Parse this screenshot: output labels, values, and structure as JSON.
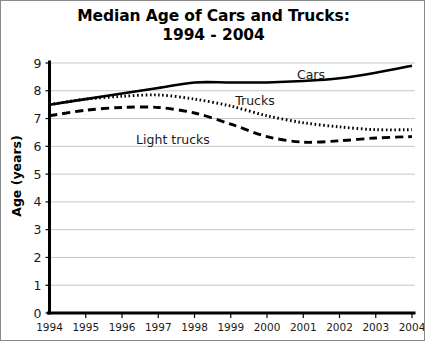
{
  "figure": {
    "title_line_1": "Median Age of Cars and Trucks:",
    "title_line_2": "1994 - 2004"
  },
  "axes": {
    "y_title": "Age (years)",
    "y_ticks": [
      "0",
      "1",
      "2",
      "3",
      "4",
      "5",
      "6",
      "7",
      "8",
      "9"
    ],
    "x_ticks": [
      "1994",
      "1995",
      "1996",
      "1997",
      "1998",
      "1999",
      "2000",
      "2001",
      "2002",
      "2003",
      "2004"
    ]
  },
  "labels": {
    "cars": "Cars",
    "trucks": "Trucks",
    "light_trucks": "Light trucks"
  },
  "chart_data": {
    "type": "line",
    "title": "Median Age of Cars and Trucks: 1994 - 2004",
    "xlabel": "",
    "ylabel": "Age (years)",
    "xlim": [
      1994,
      2004
    ],
    "ylim": [
      0,
      9
    ],
    "x": [
      1994,
      1995,
      1996,
      1997,
      1998,
      1999,
      2000,
      2001,
      2002,
      2003,
      2004
    ],
    "grid": "horizontal",
    "legend": "inline-annotations",
    "series": [
      {
        "name": "Cars",
        "style": "solid",
        "values": [
          7.5,
          7.7,
          7.9,
          8.1,
          8.3,
          8.3,
          8.3,
          8.35,
          8.45,
          8.65,
          8.9
        ]
      },
      {
        "name": "Trucks",
        "style": "dotted",
        "values": [
          7.5,
          7.7,
          7.8,
          7.85,
          7.7,
          7.45,
          7.1,
          6.85,
          6.7,
          6.6,
          6.6
        ]
      },
      {
        "name": "Light trucks",
        "style": "dashed",
        "values": [
          7.1,
          7.3,
          7.4,
          7.4,
          7.2,
          6.8,
          6.35,
          6.15,
          6.2,
          6.3,
          6.35
        ]
      }
    ]
  }
}
